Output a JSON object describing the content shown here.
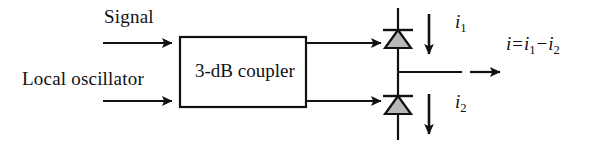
{
  "diagram": {
    "background_color": "#ffffff",
    "line_color": "#111111",
    "diode_fill_color": "#b8b8b8",
    "inputs": {
      "signal_label": "Signal",
      "local_oscillator_label": "Local oscillator"
    },
    "coupler": {
      "label": "3-dB coupler",
      "x": 180,
      "y": 37,
      "width": 126,
      "height": 70
    },
    "detectors": [
      {
        "name": "photodiode-1",
        "current_symbol": "i",
        "current_subscript": "1",
        "current_direction": "down"
      },
      {
        "name": "photodiode-2",
        "current_symbol": "i",
        "current_subscript": "2",
        "current_direction": "down"
      }
    ],
    "output": {
      "equation_lhs": "i",
      "equation_operator_equals": "=",
      "equation_term1_symbol": "i",
      "equation_term1_subscript": "1",
      "equation_operator_minus": "−",
      "equation_term2_symbol": "i",
      "equation_term2_subscript": "2"
    }
  }
}
